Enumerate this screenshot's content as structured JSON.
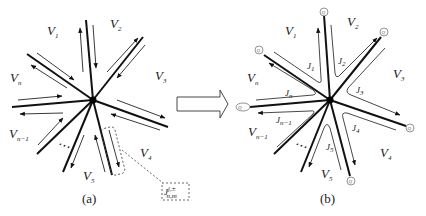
{
  "figure": {
    "panel_a": {
      "caption": "(a)",
      "regions": [
        {
          "id": "V1",
          "label": "V",
          "sub": "1"
        },
        {
          "id": "V2",
          "label": "V",
          "sub": "2"
        },
        {
          "id": "V3",
          "label": "V",
          "sub": "3"
        },
        {
          "id": "V4",
          "label": "V",
          "sub": "4"
        },
        {
          "id": "V5",
          "label": "V",
          "sub": "5"
        },
        {
          "id": "Vn-1",
          "label": "V",
          "sub": "n−1"
        },
        {
          "id": "Vn",
          "label": "V",
          "sub": "n"
        }
      ],
      "ellipsis": "⋯",
      "callout": {
        "label": "J",
        "sup": "j,±",
        "sub": "n,m"
      }
    },
    "transition_arrow": "arrow-right-outline",
    "panel_b": {
      "caption": "(b)",
      "regions": [
        {
          "id": "V1",
          "label": "V",
          "sub": "1"
        },
        {
          "id": "V2",
          "label": "V",
          "sub": "2"
        },
        {
          "id": "V3",
          "label": "V",
          "sub": "3"
        },
        {
          "id": "V4",
          "label": "V",
          "sub": "4"
        },
        {
          "id": "V5",
          "label": "V",
          "sub": "5"
        },
        {
          "id": "Vn-1",
          "label": "V",
          "sub": "n−1"
        },
        {
          "id": "Vn",
          "label": "V",
          "sub": "n"
        }
      ],
      "junctions": [
        {
          "label": "J",
          "sub": "1"
        },
        {
          "label": "J",
          "sub": "2"
        },
        {
          "label": "J",
          "sub": "3"
        },
        {
          "label": "J",
          "sub": "4"
        },
        {
          "label": "J",
          "sub": "5"
        },
        {
          "label": "J",
          "sub": "n−1"
        },
        {
          "label": "J",
          "sub": "n"
        }
      ],
      "endpoints": [
        {
          "label": "Q",
          "sub": "1"
        },
        {
          "label": "Q",
          "sub": "2"
        },
        {
          "label": "Q",
          "sub": "3"
        },
        {
          "label": "Q",
          "sub": "4"
        },
        {
          "label": "Q",
          "sub": "5"
        },
        {
          "label": "Q",
          "sub": "n−1"
        },
        {
          "label": "Q",
          "sub": "n"
        }
      ],
      "ellipsis": "⋯"
    }
  }
}
